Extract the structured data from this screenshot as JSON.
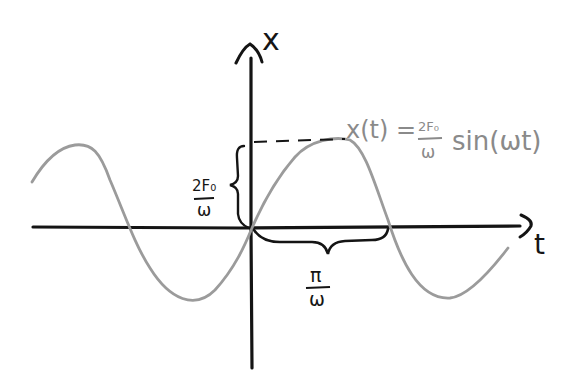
{
  "diagram": {
    "axes": {
      "y_label": "x",
      "x_label": "t"
    },
    "equation": {
      "lhs": "x(t) =",
      "frac_num": "2F₀",
      "frac_den": "ω",
      "rhs": "sin(ωt)"
    },
    "amplitude_label": {
      "num": "2F₀",
      "den": "ω"
    },
    "half_period_label": {
      "num": "π",
      "den": "ω"
    },
    "colors": {
      "axis": "#141414",
      "curve": "#9b9b9b",
      "equation": "#8a8a8a",
      "background": "#ffffff"
    }
  }
}
